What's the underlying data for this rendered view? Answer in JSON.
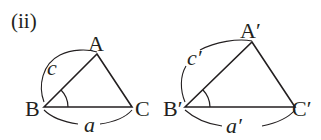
{
  "figure": {
    "label": "(ii)",
    "stroke_color": "#231f20",
    "triangle_1": {
      "vertices": {
        "A": "A",
        "B": "B",
        "C": "C"
      },
      "sides": {
        "c": "c",
        "a": "a"
      },
      "marked_angle": "B"
    },
    "triangle_2": {
      "vertices": {
        "A": "A′",
        "B": "B′",
        "C": "C′"
      },
      "sides": {
        "c": "c′",
        "a": "a′"
      },
      "marked_angle": "B′"
    }
  }
}
